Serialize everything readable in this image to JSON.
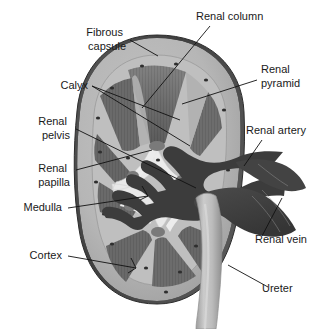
{
  "figure": {
    "style": "grayscale halftone anatomical illustration",
    "width": 315,
    "height": 329,
    "background_color": "#ffffff"
  },
  "palette": {
    "background": "#ffffff",
    "text": "#1a1a1a",
    "leader_line": "#111111",
    "fibrous_capsule": "#4a4a4a",
    "capsule_outer_rim": "#3a3a3a",
    "cortex": "#b4b4b4",
    "cortex_light": "#c6c6c6",
    "medulla_pyramid": "#6e6e6e",
    "pyramid_dark": "#5c5c5c",
    "renal_column": "#a8a8a8",
    "calyx_lumen": "#e4e4e4",
    "renal_pelvis": "#ddddddd",
    "vessel_dark": "#3c3c3c",
    "renal_vein": "#434343",
    "ureter": "#bdbdbd",
    "ureter_shadow": "#9a9a9a",
    "speckle": "#2e2e2e"
  },
  "labels": [
    {
      "id": "fibrous-capsule",
      "lines": [
        "Fibrous",
        "capsule"
      ],
      "text": "Fibrous capsule",
      "side": "left",
      "anchor": "end",
      "text_x": 126,
      "text_y": 36,
      "line_height": 14
    },
    {
      "id": "calyx",
      "lines": [
        "Calyx"
      ],
      "text": "Calyx",
      "side": "left",
      "anchor": "end",
      "text_x": 88,
      "text_y": 89,
      "line_height": 14
    },
    {
      "id": "renal-pelvis",
      "lines": [
        "Renal",
        "pelvis"
      ],
      "text": "Renal pelvis",
      "side": "left",
      "anchor": "end",
      "text_x": 70,
      "text_y": 125,
      "line_height": 14
    },
    {
      "id": "renal-papilla",
      "lines": [
        "Renal",
        "papilla"
      ],
      "text": "Renal papilla",
      "side": "left",
      "anchor": "end",
      "text_x": 70,
      "text_y": 172,
      "line_height": 14
    },
    {
      "id": "medulla",
      "lines": [
        "Medulla"
      ],
      "text": "Medulla",
      "side": "left",
      "anchor": "end",
      "text_x": 62,
      "text_y": 211,
      "line_height": 14
    },
    {
      "id": "cortex",
      "lines": [
        "Cortex"
      ],
      "text": "Cortex",
      "side": "left",
      "anchor": "end",
      "text_x": 62,
      "text_y": 259,
      "line_height": 14
    },
    {
      "id": "renal-column",
      "lines": [
        "Renal column"
      ],
      "text": "Renal column",
      "side": "top",
      "anchor": "start",
      "text_x": 196,
      "text_y": 20,
      "line_height": 14
    },
    {
      "id": "renal-pyramid",
      "lines": [
        "Renal",
        "pyramid"
      ],
      "text": "Renal pyramid",
      "side": "right",
      "anchor": "start",
      "text_x": 261,
      "text_y": 73,
      "line_height": 14
    },
    {
      "id": "renal-artery",
      "lines": [
        "Renal artery"
      ],
      "text": "Renal artery",
      "side": "right",
      "anchor": "start",
      "text_x": 246,
      "text_y": 134,
      "line_height": 14
    },
    {
      "id": "renal-vein",
      "lines": [
        "Renal vein"
      ],
      "text": "Renal vein",
      "side": "right",
      "anchor": "start",
      "text_x": 255,
      "text_y": 243,
      "line_height": 14
    },
    {
      "id": "ureter",
      "lines": [
        "Ureter"
      ],
      "text": "Ureter",
      "side": "right",
      "anchor": "start",
      "text_x": 262,
      "text_y": 292,
      "line_height": 14
    }
  ],
  "structures": [
    {
      "id": "fibrous-capsule",
      "name": "Fibrous capsule",
      "description": "dark outer rim enclosing the kidney"
    },
    {
      "id": "cortex",
      "name": "Cortex",
      "description": "pale outer parenchymal band beneath the capsule"
    },
    {
      "id": "medulla",
      "name": "Medulla",
      "description": "inner zone containing the renal pyramids"
    },
    {
      "id": "renal-pyramid",
      "name": "Renal pyramid",
      "description": "striated triangular medullary mass"
    },
    {
      "id": "renal-column",
      "name": "Renal column",
      "description": "cortical tissue extending between pyramids"
    },
    {
      "id": "renal-papilla",
      "name": "Renal papilla",
      "description": "apex of a pyramid projecting into a calyx"
    },
    {
      "id": "calyx",
      "name": "Calyx",
      "description": "cup-shaped chamber receiving urine from a papilla"
    },
    {
      "id": "renal-pelvis",
      "name": "Renal pelvis",
      "description": "funnel formed by merged calyces"
    },
    {
      "id": "renal-artery",
      "name": "Renal artery",
      "description": "branching arterial tree entering the hilum"
    },
    {
      "id": "renal-vein",
      "name": "Renal vein",
      "description": "large vessel leaving the hilum"
    },
    {
      "id": "ureter",
      "name": "Ureter",
      "description": "tube descending from the renal pelvis"
    }
  ],
  "counts": {
    "labels": 11,
    "pyramids": 7
  }
}
